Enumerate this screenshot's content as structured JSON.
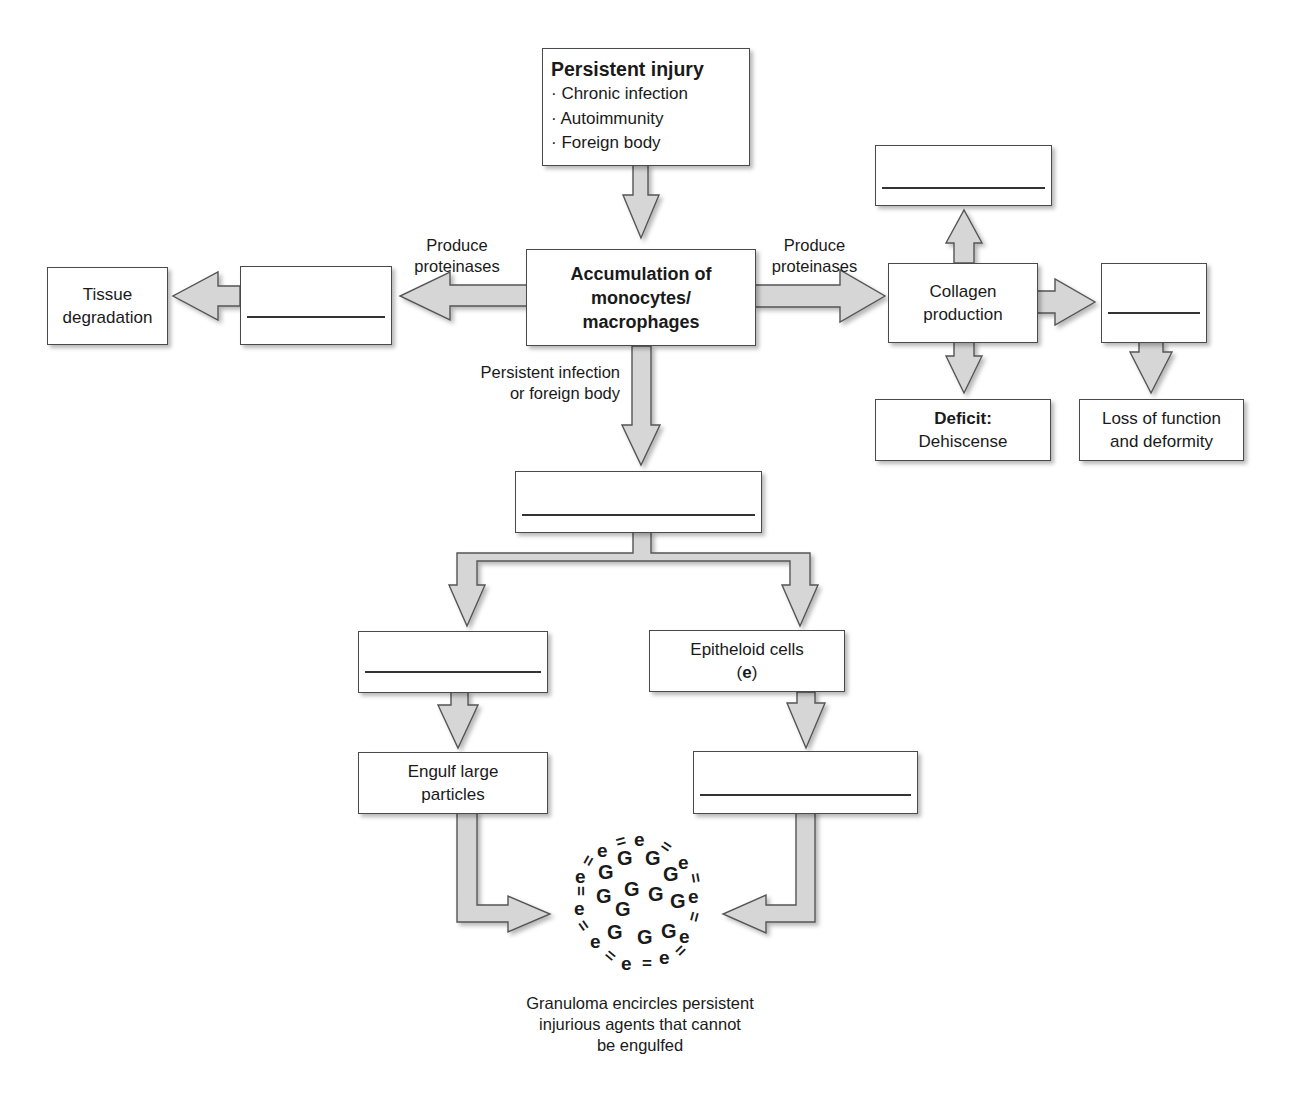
{
  "diagram": {
    "colors": {
      "arrow_fill": "#d6d6d6",
      "arrow_stroke": "#555555",
      "box_border": "#4a4a4a",
      "text": "#1a1a1a",
      "background": "#ffffff"
    },
    "nodes": {
      "persistent_injury": {
        "title": "Persistent injury",
        "bullets": [
          "· Chronic infection",
          "· Autoimmunity",
          "· Foreign body"
        ]
      },
      "accumulation": {
        "line1": "Accumulation of",
        "line2": "monocytes/",
        "line3": "macrophages"
      },
      "left_blank": {
        "text": ""
      },
      "tissue_degradation": {
        "line1": "Tissue",
        "line2": "degradation"
      },
      "collagen_production": {
        "line1": "Collagen",
        "line2": "production"
      },
      "top_right_blank": {
        "text": ""
      },
      "right_blank": {
        "text": ""
      },
      "deficit": {
        "bold": "Deficit:",
        "text": "Dehiscense"
      },
      "loss_of_function": {
        "line1": "Loss of function",
        "line2": "and deformity"
      },
      "center_blank": {
        "text": ""
      },
      "left_branch_blank": {
        "text": ""
      },
      "epitheloid_cells": {
        "line1": "Epitheloid cells",
        "paren_open": "(",
        "symbol": "e",
        "paren_close": ")"
      },
      "engulf_large_particles": {
        "line1": "Engulf large",
        "line2": "particles"
      },
      "right_branch_blank": {
        "text": ""
      }
    },
    "edge_labels": {
      "left_proteinases": {
        "line1": "Produce",
        "line2": "proteinases"
      },
      "right_proteinases": {
        "line1": "Produce",
        "line2": "proteinases"
      },
      "persistent_infection": {
        "line1": "Persistent infection",
        "line2": "or foreign body"
      }
    },
    "granuloma": {
      "giant_cell_symbol": "G",
      "epitheloid_symbol": "e",
      "connector_symbol": "=",
      "caption": {
        "line1": "Granuloma encircles persistent",
        "line2": "injurious agents that cannot",
        "line3": "be engulfed"
      }
    }
  }
}
